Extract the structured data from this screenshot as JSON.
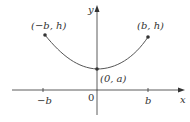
{
  "diagram": {
    "type": "catenary-on-axes",
    "colors": {
      "axis": "#333333",
      "curve": "#555555",
      "point": "#333333",
      "text": "#333333"
    },
    "axes": {
      "x_label": "x",
      "y_label": "y",
      "origin_label": "0"
    },
    "ticks": [
      {
        "label": "−b",
        "x": 43
      },
      {
        "label": "b",
        "x": 148
      }
    ],
    "points": [
      {
        "label": "(−b, h)",
        "x": 45,
        "y": 35
      },
      {
        "label": "(b, h)",
        "x": 148,
        "y": 37
      },
      {
        "label": "(0, a)",
        "x": 97,
        "y": 69
      }
    ]
  }
}
